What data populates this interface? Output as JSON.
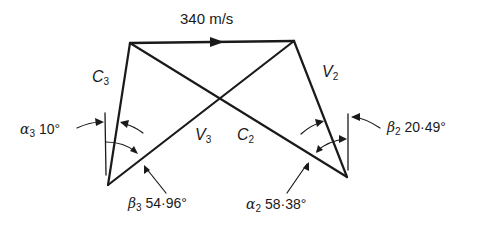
{
  "diagram": {
    "type": "velocity-triangles",
    "stroke_color": "#1a1a1a",
    "background": "#ffffff",
    "blade_speed_label": "340 m/s",
    "vectors": {
      "C3": {
        "symbol": "C",
        "subscript": "3"
      },
      "V2": {
        "symbol": "V",
        "subscript": "2"
      },
      "V3": {
        "symbol": "V",
        "subscript": "3"
      },
      "C2": {
        "symbol": "C",
        "subscript": "2"
      }
    },
    "angles": {
      "alpha3": {
        "symbol": "α",
        "subscript": "3",
        "value": "10°"
      },
      "beta3": {
        "symbol": "β",
        "subscript": "3",
        "value": "54·96°"
      },
      "alpha2": {
        "symbol": "α",
        "subscript": "2",
        "value": "58·38°"
      },
      "beta2": {
        "symbol": "β",
        "subscript": "2",
        "value": "20·49°"
      }
    }
  }
}
